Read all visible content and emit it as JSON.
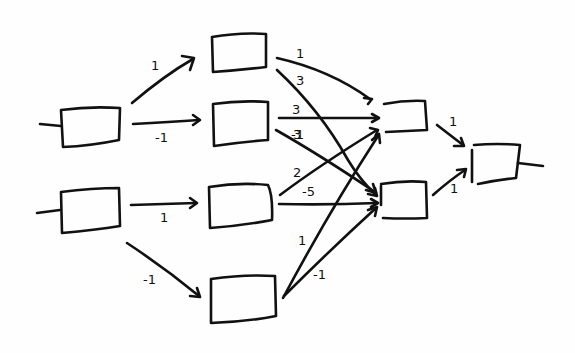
{
  "diagram": {
    "type": "neural-network",
    "style": "hand-drawn",
    "layers": [
      {
        "name": "input",
        "nodes": [
          "in1",
          "in2"
        ]
      },
      {
        "name": "hidden1",
        "nodes": [
          "h1",
          "h2",
          "h3",
          "h4"
        ]
      },
      {
        "name": "hidden2",
        "nodes": [
          "g1",
          "g2"
        ]
      },
      {
        "name": "output",
        "nodes": [
          "out"
        ]
      }
    ],
    "edges": [
      {
        "from": "in1",
        "to": "h1",
        "weight": "1"
      },
      {
        "from": "in1",
        "to": "h2",
        "weight": "-1"
      },
      {
        "from": "in2",
        "to": "h3",
        "weight": "1"
      },
      {
        "from": "in2",
        "to": "h4",
        "weight": "-1"
      },
      {
        "from": "h1",
        "to": "g1",
        "weight": "1"
      },
      {
        "from": "h1",
        "to": "g2",
        "weight": "3"
      },
      {
        "from": "h2",
        "to": "g1",
        "weight": "3"
      },
      {
        "from": "h2",
        "to": "g2",
        "weight": "-1"
      },
      {
        "from": "h3",
        "to": "g1",
        "weight": "2"
      },
      {
        "from": "h3",
        "to": "g2",
        "weight": "-5"
      },
      {
        "from": "h4",
        "to": "g1",
        "weight": "1"
      },
      {
        "from": "h4",
        "to": "g2",
        "weight": "-1"
      },
      {
        "from": "g1",
        "to": "out",
        "weight": "1"
      },
      {
        "from": "g2",
        "to": "out",
        "weight": "1"
      }
    ]
  },
  "labels": {
    "in1_h1": "1",
    "in1_h2": "-1",
    "in2_h3": "1",
    "in2_h4": "-1",
    "h1_g1": "1",
    "h1_g2": "3",
    "h2_g1": "3",
    "h2_g2": "-1",
    "h3_g1": "2",
    "h3_g2": "-5",
    "h4_g1": "1",
    "h4_g2": "-1",
    "g1_out": "1",
    "g2_out": "1"
  }
}
